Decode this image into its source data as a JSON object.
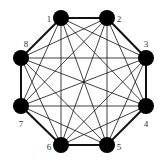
{
  "diagram": {
    "type": "complete-graph",
    "nodes": [
      {
        "id": "1",
        "label": "1",
        "x": 61,
        "y": 18,
        "lx": 49,
        "ly": 19
      },
      {
        "id": "2",
        "label": "2",
        "x": 107,
        "y": 18,
        "lx": 119,
        "ly": 19
      },
      {
        "id": "3",
        "label": "3",
        "x": 146,
        "y": 58,
        "lx": 146,
        "ly": 44
      },
      {
        "id": "4",
        "label": "4",
        "x": 146,
        "y": 106,
        "lx": 146,
        "ly": 124
      },
      {
        "id": "5",
        "label": "5",
        "x": 107,
        "y": 145,
        "lx": 119,
        "ly": 147
      },
      {
        "id": "6",
        "label": "6",
        "x": 61,
        "y": 145,
        "lx": 49,
        "ly": 147
      },
      {
        "id": "7",
        "label": "7",
        "x": 21,
        "y": 106,
        "lx": 21,
        "ly": 124
      },
      {
        "id": "8",
        "label": "8",
        "x": 21,
        "y": 58,
        "lx": 26,
        "ly": 44
      }
    ],
    "outer_cycle": [
      "1",
      "2",
      "3",
      "4",
      "5",
      "6",
      "7",
      "8"
    ],
    "node_color": "#000000",
    "edge_color": "#111111"
  },
  "caption": ""
}
